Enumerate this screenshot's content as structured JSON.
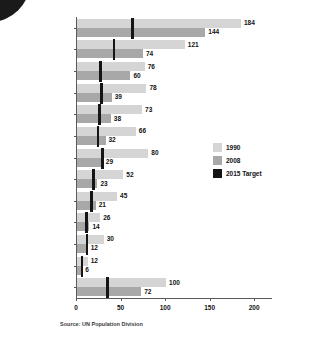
{
  "decor": {
    "ghost_title": ""
  },
  "source_note": "Source: UN Population Division",
  "legend": {
    "items": [
      {
        "label": "1990",
        "color": "#d5d5d5"
      },
      {
        "label": "2008",
        "color": "#a8a8a8"
      },
      {
        "label": "2015 Target",
        "color": "#151515"
      }
    ]
  },
  "chart_data": {
    "type": "bar",
    "orientation": "horizontal",
    "title": "",
    "xlabel": "",
    "ylabel": "",
    "xlim": [
      0,
      220
    ],
    "xticks": [
      0,
      50,
      100,
      150,
      200
    ],
    "grid": false,
    "legend_position": "right",
    "categories": [
      "Sub-Saharan Africa",
      "Southern Asia",
      "Oceania",
      "CIS Asia",
      "South-Eastern Asia",
      "Western Asia",
      "Northern Africa",
      "Latin America &\nthe Caribbean",
      "Eastern Asia",
      "CIS Europe",
      "Transition countries of\nSouth-Eastern Europe",
      "Developed regions",
      "Developing regions"
    ],
    "series": [
      {
        "name": "1990",
        "color": "#d5d5d5",
        "values": [
          184,
          121,
          76,
          78,
          73,
          66,
          80,
          52,
          45,
          26,
          30,
          12,
          100
        ]
      },
      {
        "name": "2008",
        "color": "#a8a8a8",
        "values": [
          144,
          74,
          60,
          39,
          38,
          32,
          29,
          23,
          21,
          14,
          12,
          6,
          72
        ]
      },
      {
        "name": "2015 Target",
        "color": "#151515",
        "marker": "vertical-tick",
        "values": [
          61,
          40,
          25,
          26,
          24,
          22,
          27,
          17,
          15,
          9,
          10,
          4,
          33
        ]
      }
    ]
  },
  "rows": [
    {
      "label": "Sub-Saharan Africa",
      "label2": "",
      "v1990": 184,
      "v2008": 144,
      "target": 61
    },
    {
      "label": "Southern Asia",
      "label2": "",
      "v1990": 121,
      "v2008": 74,
      "target": 40
    },
    {
      "label": "Oceania",
      "label2": "",
      "v1990": 76,
      "v2008": 60,
      "target": 25
    },
    {
      "label": "CIS Asia",
      "label2": "",
      "v1990": 78,
      "v2008": 39,
      "target": 26
    },
    {
      "label": "South-Eastern Asia",
      "label2": "",
      "v1990": 73,
      "v2008": 38,
      "target": 24
    },
    {
      "label": "Western Asia",
      "label2": "",
      "v1990": 66,
      "v2008": 32,
      "target": 22
    },
    {
      "label": "Northern Africa",
      "label2": "",
      "v1990": 80,
      "v2008": 29,
      "target": 27
    },
    {
      "label": "Latin America &",
      "label2": "the Caribbean",
      "v1990": 52,
      "v2008": 23,
      "target": 17
    },
    {
      "label": "Eastern Asia",
      "label2": "",
      "v1990": 45,
      "v2008": 21,
      "target": 15
    },
    {
      "label": "CIS Europe",
      "label2": "",
      "v1990": 26,
      "v2008": 14,
      "target": 9
    },
    {
      "label": "Transition countries of",
      "label2": "South-Eastern Europe",
      "v1990": 30,
      "v2008": 12,
      "target": 10
    },
    {
      "label": "Developed regions",
      "label2": "",
      "v1990": 12,
      "v2008": 6,
      "target": 4
    },
    {
      "label": "Developing regions",
      "label2": "",
      "v1990": 100,
      "v2008": 72,
      "target": 33
    }
  ]
}
